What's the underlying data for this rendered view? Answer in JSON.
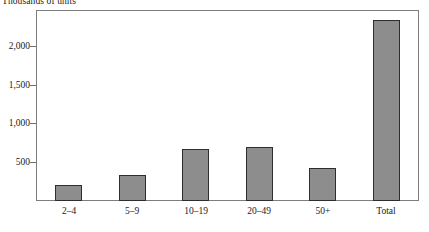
{
  "chart_data": {
    "type": "bar",
    "title": "",
    "subtitle": "",
    "unit_caption": "Thousands of units",
    "xlabel": "",
    "ylabel": "Thousands of units",
    "categories": [
      "2–4",
      "5–9",
      "10–19",
      "20–49",
      "50+",
      "Total"
    ],
    "values": [
      210,
      340,
      670,
      690,
      430,
      2340
    ],
    "ylim": [
      0,
      2450
    ],
    "yticks": [
      500,
      1000,
      1500,
      2000
    ],
    "ytick_labels": [
      "500",
      "1,000",
      "1,500",
      "2,000"
    ],
    "grid": false,
    "legend": null,
    "bar_color": "#8d8d8d",
    "bar_edge_color": "#2e2e2e",
    "frame_color": "#7d7d7d",
    "text_color": "#1a1a1a",
    "background": "#ffffff"
  }
}
